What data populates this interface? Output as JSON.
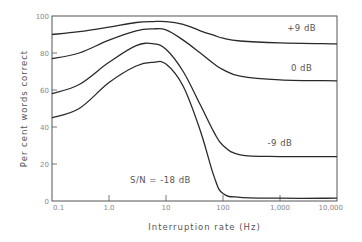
{
  "chart_data": {
    "type": "line",
    "title": "",
    "xlabel": "Interruption rate (Hz)",
    "ylabel": "Per cent words correct",
    "xscale": "log",
    "xlim": [
      0.1,
      10000
    ],
    "ylim": [
      0,
      100
    ],
    "grid": false,
    "x_ticks": [
      {
        "value": 0.1,
        "label": "0.1"
      },
      {
        "value": 1,
        "label": "1.0"
      },
      {
        "value": 10,
        "label": "10"
      },
      {
        "value": 100,
        "label": "100"
      },
      {
        "value": 1000,
        "label": "1,000"
      },
      {
        "value": 10000,
        "label": "10,000"
      }
    ],
    "y_ticks": [
      {
        "value": 0,
        "label": "0"
      },
      {
        "value": 20,
        "label": "20"
      },
      {
        "value": 40,
        "label": "40"
      },
      {
        "value": 60,
        "label": "60"
      },
      {
        "value": 80,
        "label": "80"
      },
      {
        "value": 100,
        "label": "100"
      }
    ],
    "x": [
      0.1,
      0.3,
      1,
      3,
      6,
      10,
      20,
      40,
      70,
      100,
      200,
      1000,
      10000
    ],
    "series": [
      {
        "name": "+9 dB",
        "label": "+9 dB",
        "values": [
          90,
          91.5,
          94,
          96.5,
          97,
          97,
          95.5,
          92,
          89.5,
          88,
          86.5,
          85.5,
          85
        ]
      },
      {
        "name": "0 dB",
        "label": "0 dB",
        "values": [
          77,
          80,
          87,
          92,
          93,
          92.5,
          87,
          80,
          74,
          71,
          67.5,
          65.5,
          65
        ]
      },
      {
        "name": "-9 dB",
        "label": "-9 dB",
        "values": [
          58,
          63,
          75,
          84,
          85,
          82,
          70,
          52,
          37,
          30,
          25,
          24,
          24
        ]
      },
      {
        "name": "S/N = -18 dB",
        "label": "S/N = -18 dB",
        "values": [
          45,
          50,
          64,
          73,
          75,
          74,
          62,
          38,
          13,
          4,
          2,
          1.5,
          1.5
        ]
      }
    ],
    "annotations": [
      {
        "text": "+9 dB",
        "x": 2400,
        "y": 92
      },
      {
        "text": "0 dB",
        "x": 2400,
        "y": 70.5
      },
      {
        "text": "-9 dB",
        "x": 1000,
        "y": 30
      },
      {
        "text": "S/N = -18 dB",
        "x": 8,
        "y": 10
      }
    ],
    "legend": "none (curves labeled inline)"
  },
  "colors": {
    "line": "#2a2a2a",
    "axis": "#555555",
    "text": "#666666"
  }
}
